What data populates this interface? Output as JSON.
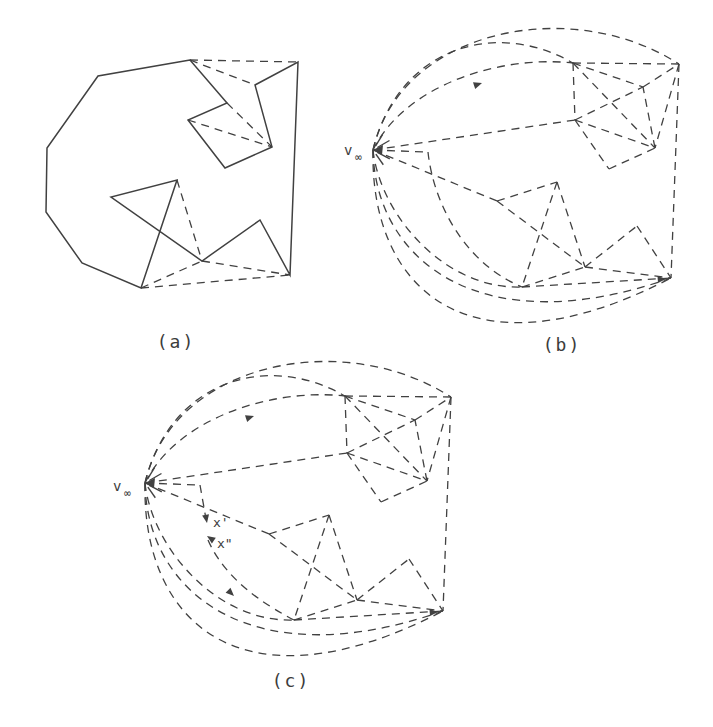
{
  "style": {
    "background": "#ffffff",
    "line_color": "#414141",
    "dash_pattern": "8 6",
    "solid_width": 1.5,
    "dash_width": 1.3,
    "font_color": "#3c3c3c"
  },
  "panels": {
    "a": {
      "caption": "(a)",
      "caption_pos": [
        176,
        348
      ],
      "points": {
        "P1": [
          190,
          60
        ],
        "A2": [
          98,
          76
        ],
        "A3": [
          47,
          148
        ],
        "A4": [
          46,
          212
        ],
        "A5": [
          82,
          263
        ],
        "A6": [
          141,
          288
        ],
        "WP": [
          177,
          180
        ],
        "W1": [
          111,
          197
        ],
        "WM": [
          202,
          261
        ],
        "M1": [
          260,
          220
        ],
        "BR": [
          290,
          275
        ],
        "P2": [
          298,
          62
        ],
        "Sd": [
          255,
          85
        ],
        "Sc": [
          272,
          147
        ],
        "Sb": [
          225,
          168
        ],
        "Sa": [
          188,
          120
        ],
        "P8": [
          227,
          103
        ]
      },
      "outline": [
        "P1",
        "A2",
        "A3",
        "A4",
        "A5",
        "A6",
        "WP",
        "W1",
        "WM",
        "M1",
        "BR",
        "P2",
        "Sd",
        "Sc",
        "Sb",
        "Sa",
        "P8"
      ],
      "dashed_edges": [
        [
          "P1",
          "P2"
        ],
        [
          "P1",
          "Sd"
        ],
        [
          "P8",
          "Sc"
        ],
        [
          "Sa",
          "Sc"
        ],
        [
          "WP",
          "WM"
        ],
        [
          "A6",
          "WM"
        ],
        [
          "WM",
          "BR"
        ],
        [
          "A6",
          "BR"
        ]
      ]
    },
    "b": {
      "caption": "(b)",
      "caption_pos": [
        562,
        351
      ],
      "vinf": {
        "label": "v",
        "sub": "∞",
        "pos": [
          373,
          150
        ],
        "label_pos": [
          344,
          155
        ],
        "sub_pos": [
          355,
          161
        ]
      },
      "points": {
        "vinf": [
          373,
          150
        ],
        "P1": [
          573,
          63
        ],
        "P2": [
          679,
          64
        ],
        "Sa": [
          575,
          120
        ],
        "Sb": [
          609,
          169
        ],
        "Sc": [
          655,
          148
        ],
        "Sd": [
          643,
          87
        ],
        "W1": [
          497,
          201
        ],
        "WP": [
          557,
          182
        ],
        "WM": [
          585,
          267
        ],
        "A6": [
          522,
          287
        ],
        "M1": [
          637,
          226
        ],
        "BR": [
          671,
          278
        ],
        "C1": [
          428,
          152
        ]
      },
      "dashed_edges": [
        [
          "P1",
          "P2"
        ],
        [
          "P1",
          "Sa"
        ],
        [
          "Sa",
          "Sb"
        ],
        [
          "Sb",
          "Sc"
        ],
        [
          "Sc",
          "Sd"
        ],
        [
          "Sd",
          "P2"
        ],
        [
          "P1",
          "Sd"
        ],
        [
          "P1",
          "Sc"
        ],
        [
          "Sa",
          "Sc"
        ],
        [
          "Sa",
          "Sd"
        ],
        [
          "P2",
          "Sc"
        ],
        [
          "P2",
          "BR"
        ],
        [
          "M1",
          "BR"
        ],
        [
          "WM",
          "M1"
        ],
        [
          "W1",
          "WP"
        ],
        [
          "W1",
          "WM"
        ],
        [
          "WP",
          "A6"
        ],
        [
          "WP",
          "WM"
        ],
        [
          "A6",
          "WM"
        ],
        [
          "WM",
          "BR"
        ],
        [
          "A6",
          "BR"
        ],
        [
          "vinf",
          "Sa"
        ],
        [
          "vinf",
          "W1"
        ],
        [
          "vinf",
          "C1"
        ]
      ],
      "arcs": [
        {
          "id": "T1",
          "c": [
            [
              373,
              150
            ],
            [
              400,
              30
            ],
            [
              570,
              -6
            ],
            [
              679,
              64
            ]
          ]
        },
        {
          "id": "T2",
          "c": [
            [
              373,
              150
            ],
            [
              398,
              48
            ],
            [
              495,
              18
            ],
            [
              573,
              63
            ]
          ]
        },
        {
          "id": "T3",
          "c": [
            [
              373,
              150
            ],
            [
              405,
              85
            ],
            [
              500,
              55
            ],
            [
              573,
              63
            ]
          ]
        },
        {
          "id": "B1",
          "c": [
            [
              373,
              150
            ],
            [
              380,
              215
            ],
            [
              445,
              290
            ],
            [
              522,
              287
            ]
          ]
        },
        {
          "id": "B2",
          "c": [
            [
              373,
              150
            ],
            [
              375,
              260
            ],
            [
              480,
              345
            ],
            [
              671,
              278
            ]
          ]
        },
        {
          "id": "B3",
          "c": [
            [
              373,
              150
            ],
            [
              370,
              290
            ],
            [
              470,
              382
            ],
            [
              671,
              278
            ]
          ]
        },
        {
          "id": "h1curve",
          "c": [
            [
              428,
              152
            ],
            [
              433,
              200
            ],
            [
              462,
              262
            ],
            [
              522,
              287
            ]
          ]
        }
      ],
      "arrows": [
        {
          "tip": [
            666,
            279
          ],
          "ang": -4
        },
        {
          "tip": [
            482,
            83
          ],
          "ang": -18
        }
      ]
    },
    "c": {
      "caption": "(c)",
      "caption_pos": [
        291,
        687
      ],
      "offset": [
        -228,
        333
      ],
      "vinf": {
        "label": "v",
        "sub": "∞",
        "label_pos": [
          113,
          491
        ],
        "sub_pos": [
          124,
          497
        ]
      },
      "exclude_arcs": [
        "h1curve"
      ],
      "x_labels": [
        {
          "text": "x'",
          "pos": [
            213,
            527
          ]
        },
        {
          "text": "x\"",
          "pos": [
            217,
            548
          ]
        }
      ],
      "extra_lines": [
        [
          [
            200,
            485
          ],
          [
            206,
            519
          ]
        ]
      ],
      "extra_cubics": [
        [
          [
            208,
            540
          ],
          [
            218,
            563
          ],
          [
            240,
            592
          ],
          [
            294,
            620
          ]
        ]
      ],
      "extra_arrows": [
        {
          "tip": [
            207,
            523
          ],
          "ang": 80
        },
        {
          "tip": [
            207,
            536
          ],
          "ang": 214
        },
        {
          "tip": [
            234,
            596
          ],
          "ang": 44
        }
      ]
    }
  }
}
